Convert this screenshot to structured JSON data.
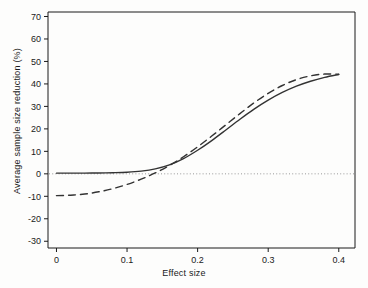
{
  "chart_data": {
    "type": "line",
    "title": "",
    "xlabel": "Effect size",
    "ylabel": "Average sample size reduction (%)",
    "xlim": [
      -0.012,
      0.423
    ],
    "ylim": [
      -33,
      72
    ],
    "xticks": [
      0,
      0.1,
      0.2,
      0.3,
      0.4
    ],
    "xticklabels": [
      "0",
      "0.1",
      "0.2",
      "0.3",
      "0.4"
    ],
    "yticks": [
      -30,
      -20,
      -10,
      0,
      10,
      20,
      30,
      40,
      50,
      60,
      70
    ],
    "yticklabels": [
      "-30",
      "-20",
      "-10",
      "0",
      "10",
      "20",
      "30",
      "40",
      "50",
      "60",
      "70"
    ],
    "grid": false,
    "legend": null,
    "reference_line": {
      "name": "zero-line",
      "orientation": "horizontal",
      "y": 0,
      "style": "dotted",
      "color": "#999999"
    },
    "series": [
      {
        "name": "solid-curve",
        "style": "solid",
        "color": "#333333",
        "x": [
          0.0,
          0.02,
          0.04,
          0.06,
          0.08,
          0.1,
          0.12,
          0.14,
          0.16,
          0.18,
          0.2,
          0.22,
          0.24,
          0.26,
          0.28,
          0.3,
          0.32,
          0.34,
          0.36,
          0.38,
          0.4
        ],
        "y": [
          0.3,
          0.3,
          0.3,
          0.4,
          0.5,
          0.7,
          1.2,
          2.2,
          4.0,
          6.8,
          10.5,
          14.8,
          19.5,
          24.3,
          28.8,
          32.8,
          36.2,
          39.0,
          41.2,
          42.9,
          44.2
        ]
      },
      {
        "name": "dashed-curve",
        "style": "dashed",
        "color": "#333333",
        "x": [
          0.0,
          0.02,
          0.04,
          0.06,
          0.08,
          0.1,
          0.12,
          0.14,
          0.16,
          0.18,
          0.2,
          0.22,
          0.24,
          0.26,
          0.28,
          0.3,
          0.32,
          0.34,
          0.36,
          0.38,
          0.4
        ],
        "y": [
          -9.7,
          -9.5,
          -9.0,
          -8.0,
          -6.6,
          -4.7,
          -2.4,
          0.4,
          3.7,
          7.6,
          12.0,
          16.8,
          21.8,
          26.8,
          31.6,
          35.8,
          39.3,
          41.9,
          43.6,
          44.4,
          44.3
        ]
      }
    ]
  }
}
